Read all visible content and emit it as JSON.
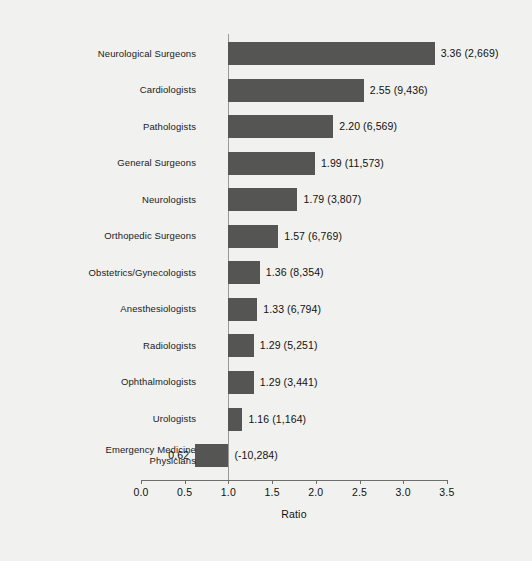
{
  "chart_data": {
    "type": "bar",
    "orientation": "horizontal",
    "title": "",
    "xlabel": "Ratio",
    "ylabel": "",
    "xlim": [
      0.0,
      3.5
    ],
    "xticks": [
      "0.0",
      "0.5",
      "1.0",
      "1.5",
      "2.0",
      "2.5",
      "3.0",
      "3.5"
    ],
    "xtick_values": [
      0.0,
      0.5,
      1.0,
      1.5,
      2.0,
      2.5,
      3.0,
      3.5
    ],
    "grid": false,
    "legend": null,
    "reference_line": 1.0,
    "baseline": 1.0,
    "bar_color": "#555553",
    "background_color": "#f1f1ef",
    "categories": [
      "Neurological Surgeons",
      "Cardiologists",
      "Pathologists",
      "General Surgeons",
      "Neurologists",
      "Orthopedic Surgeons",
      "Obstetrics/Gynecologists",
      "Anesthesiologists",
      "Radiologists",
      "Ophthalmologists",
      "Urologists",
      "Emergency Medicine\nPhysicians"
    ],
    "values": [
      3.36,
      2.55,
      2.2,
      1.99,
      1.79,
      1.57,
      1.36,
      1.33,
      1.29,
      1.29,
      1.16,
      0.62
    ],
    "counts": [
      "(2,669)",
      "(9,436)",
      "(6,569)",
      "(11,573)",
      "(3,807)",
      "(6,769)",
      "(8,354)",
      "(6,794)",
      "(5,251)",
      "(3,441)",
      "(1,164)",
      "(-10,284)"
    ],
    "data_labels": [
      "3.36  (2,669)",
      "2.55  (9,436)",
      "2.20 (6,569)",
      "1.99  (11,573)",
      "1.79 (3,807)",
      "1.57 (6,769)",
      "1.36  (8,354)",
      "1.33  (6,794)",
      "1.29  (5,251)",
      "1.29 (3,441)",
      "1.16 (1,164)",
      "(-10,284)"
    ],
    "points": [
      {
        "category": "Neurological Surgeons",
        "ratio": 3.36,
        "count": "(2,669)",
        "label": "3.36  (2,669)",
        "label_side": "right"
      },
      {
        "category": "Cardiologists",
        "ratio": 2.55,
        "count": "(9,436)",
        "label": "2.55  (9,436)",
        "label_side": "right"
      },
      {
        "category": "Pathologists",
        "ratio": 2.2,
        "count": "(6,569)",
        "label": "2.20 (6,569)",
        "label_side": "right"
      },
      {
        "category": "General Surgeons",
        "ratio": 1.99,
        "count": "(11,573)",
        "label": "1.99  (11,573)",
        "label_side": "right"
      },
      {
        "category": "Neurologists",
        "ratio": 1.79,
        "count": "(3,807)",
        "label": "1.79 (3,807)",
        "label_side": "right"
      },
      {
        "category": "Orthopedic Surgeons",
        "ratio": 1.57,
        "count": "(6,769)",
        "label": "1.57 (6,769)",
        "label_side": "right"
      },
      {
        "category": "Obstetrics/Gynecologists",
        "ratio": 1.36,
        "count": "(8,354)",
        "label": "1.36  (8,354)",
        "label_side": "right"
      },
      {
        "category": "Anesthesiologists",
        "ratio": 1.33,
        "count": "(6,794)",
        "label": "1.33  (6,794)",
        "label_side": "right"
      },
      {
        "category": "Radiologists",
        "ratio": 1.29,
        "count": "(5,251)",
        "label": "1.29  (5,251)",
        "label_side": "right"
      },
      {
        "category": "Ophthalmologists",
        "ratio": 1.29,
        "count": "(3,441)",
        "label": "1.29 (3,441)",
        "label_side": "right"
      },
      {
        "category": "Urologists",
        "ratio": 1.16,
        "count": "(1,164)",
        "label": "1.16 (1,164)",
        "label_side": "right"
      },
      {
        "category": "Emergency Medicine Physicians",
        "ratio": 0.62,
        "count": "(-10,284)",
        "label": "(-10,284)",
        "label_side": "right",
        "value_label_left": "0.62"
      }
    ]
  }
}
